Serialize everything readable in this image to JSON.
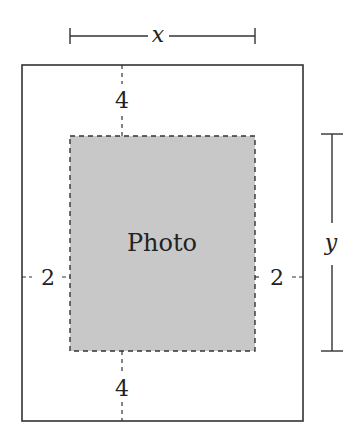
{
  "diagram": {
    "type": "framed-photo-dimensions",
    "colors": {
      "line": "#333333",
      "photo_fill": "#c8c8c8",
      "background": "#ffffff"
    },
    "photo": {
      "label": "Photo"
    },
    "margins": {
      "top": "4",
      "bottom": "4",
      "left": "2",
      "right": "2"
    },
    "dimensions": {
      "width_label": "x",
      "height_label": "y"
    }
  }
}
